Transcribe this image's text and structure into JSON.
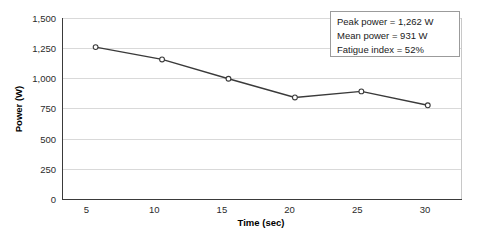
{
  "chart_data": {
    "type": "line",
    "title": "",
    "xlabel": "Time (sec)",
    "ylabel": "Power (W)",
    "x": [
      5,
      10,
      15,
      20,
      25,
      30
    ],
    "values": [
      1262,
      1160,
      1000,
      845,
      895,
      780
    ],
    "series": [
      {
        "name": "Power",
        "values": [
          1262,
          1160,
          1000,
          845,
          895,
          780
        ]
      }
    ],
    "xlim": [
      2.5,
      32.5
    ],
    "ylim": [
      0,
      1500
    ],
    "xticks": [
      "5",
      "10",
      "15",
      "20",
      "25",
      "30"
    ],
    "yticks": [
      "0",
      "250",
      "500",
      "750",
      "1,000",
      "1,250",
      "1,500"
    ],
    "ytick_values": [
      0,
      250,
      500,
      750,
      1000,
      1250,
      1500
    ],
    "grid": "horizontal",
    "legend": "none",
    "marker": "open-circle",
    "line_color": "#3a3a3a",
    "grid_color": "#d9d9d9"
  },
  "annotation": {
    "lines": [
      "Peak power = 1,262 W",
      "Mean power = 931 W",
      "Fatigue index = 52%"
    ],
    "peak_power": "Peak power = 1,262 W",
    "mean_power": "Mean power = 931 W",
    "fatigue_index": "Fatigue index = 52%",
    "border_color": "#9b9b9b"
  }
}
